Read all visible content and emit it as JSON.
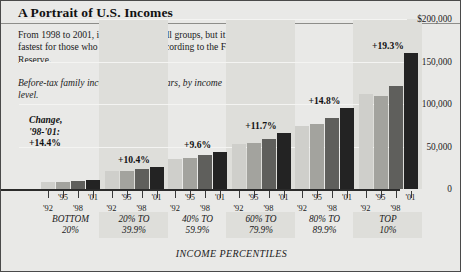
{
  "title": "A Portrait of U.S. Incomes",
  "deck": "From 1998 to 2001, income grew for all groups, but it grew the fastest for those who earn the most, according to the Federal Reserve.",
  "subdeck": "Before-tax family income, in 2001 dollars, by income level.",
  "change_legend": {
    "line1": "Change,",
    "line2": "'98-'01:",
    "line3": "+14.4%"
  },
  "colors": {
    "background": "#e9e9e7",
    "band": "#dededa",
    "border": "#4a4a4a",
    "series_1992": "#cfcfcb",
    "series_1995": "#a3a39e",
    "series_1998": "#5f5f5c",
    "series_2001": "#232323"
  },
  "chart_data": {
    "type": "bar",
    "title": "A Portrait of U.S. Incomes",
    "subtitle": "Before-tax family income, in 2001 dollars, by income level.",
    "xlabel": "INCOME PERCENTILES",
    "ylabel": "",
    "ylim": [
      0,
      200000
    ],
    "yticks": [
      0,
      50000,
      100000,
      150000,
      200000
    ],
    "ytick_labels": [
      "0",
      "50,000",
      "100,000",
      "150,000",
      "$200,000"
    ],
    "grid": true,
    "legend": "none",
    "categories": [
      "BOTTOM 20%",
      "20% TO 39.9%",
      "40% TO 59.9%",
      "60% TO 79.9%",
      "80% TO 89.9%",
      "TOP 10%"
    ],
    "category_lines": [
      [
        "BOTTOM",
        "20%"
      ],
      [
        "20% TO",
        "39.9%"
      ],
      [
        "40% TO",
        "59.9%"
      ],
      [
        "60% TO",
        "79.9%"
      ],
      [
        "80% TO",
        "89.9%"
      ],
      [
        "TOP",
        "10%"
      ]
    ],
    "x_tick_labels": [
      "'92",
      "'95",
      "'98",
      "'01"
    ],
    "series": [
      {
        "name": "'92",
        "values": [
          8500,
          21000,
          35000,
          53000,
          74000,
          112000
        ]
      },
      {
        "name": "'95",
        "values": [
          8800,
          21500,
          36500,
          54500,
          76000,
          110000
        ]
      },
      {
        "name": "'98",
        "values": [
          9500,
          23500,
          39500,
          59000,
          83000,
          121000
        ]
      },
      {
        "name": "'01",
        "values": [
          10900,
          26000,
          43500,
          66000,
          95000,
          160000
        ]
      }
    ],
    "annotations": [
      {
        "category": "BOTTOM 20%",
        "label": "+14.4%"
      },
      {
        "category": "20% TO 39.9%",
        "label": "+10.4%"
      },
      {
        "category": "40% TO 59.9%",
        "label": "+9.6%"
      },
      {
        "category": "60% TO 79.9%",
        "label": "+11.7%"
      },
      {
        "category": "80% TO 89.9%",
        "label": "+14.8%"
      },
      {
        "category": "TOP 10%",
        "label": "+19.3%"
      }
    ]
  }
}
